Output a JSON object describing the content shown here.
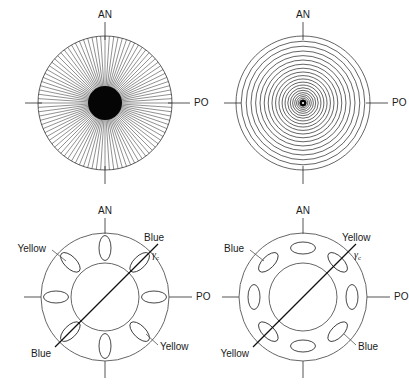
{
  "figure": {
    "width": 409,
    "height": 387,
    "background": "#ffffff",
    "stroke_color": "#222222",
    "panels": [
      {
        "id": "top-left",
        "name": "radial-spoke-pattern",
        "pattern": "radial",
        "center": [
          105,
          103
        ],
        "radius": 67,
        "spoke_count": 96,
        "core_radius": 17,
        "axis_labels": {
          "top": "AN",
          "right": "PO"
        }
      },
      {
        "id": "top-right",
        "name": "concentric-circle-pattern",
        "pattern": "concentric",
        "center": [
          303,
          103
        ],
        "radius": 67,
        "ring_count": 24,
        "core_radius": 4,
        "axis_labels": {
          "top": "AN",
          "right": "PO"
        }
      },
      {
        "id": "bottom-left",
        "name": "radial-ellipse-annulus",
        "pattern": "annulus-radial-ellipses",
        "center": [
          105,
          297
        ],
        "outer_radius": 64,
        "inner_radius": 34,
        "ellipse_count": 8,
        "ellipse_orientation": "radial",
        "gamma_angle_deg": 45,
        "axis_labels": {
          "top": "AN",
          "right": "PO"
        },
        "quadrant_labels": {
          "upper_right": "Blue",
          "upper_left": "Yellow",
          "lower_left": "Blue",
          "lower_right": "Yellow"
        },
        "gamma_symbol": "γ",
        "gamma_subscript": "c"
      },
      {
        "id": "bottom-right",
        "name": "tangential-ellipse-annulus",
        "pattern": "annulus-tangential-ellipses",
        "center": [
          303,
          297
        ],
        "outer_radius": 64,
        "inner_radius": 34,
        "ellipse_count": 8,
        "ellipse_orientation": "tangential",
        "gamma_angle_deg": 45,
        "axis_labels": {
          "top": "AN",
          "right": "PO"
        },
        "quadrant_labels": {
          "upper_right": "Yellow",
          "upper_left": "Blue",
          "lower_left": "Yellow",
          "lower_right": "Blue"
        },
        "gamma_symbol": "γ",
        "gamma_subscript": "c"
      }
    ],
    "labels": {
      "anterior": "AN",
      "posterior": "PO",
      "blue": "Blue",
      "yellow": "Yellow",
      "gamma": "γ",
      "gamma_sub": "c"
    }
  }
}
